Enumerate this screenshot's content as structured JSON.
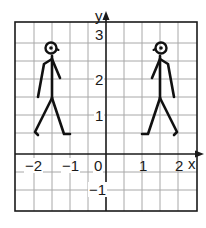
{
  "diagram": {
    "type": "coordinate-grid-reflection",
    "colors": {
      "grid": "#a8a8a8",
      "axes": "#1a1a1a",
      "border": "#1a1a1a",
      "figure": "#111111",
      "background": "#ffffff"
    },
    "axes": {
      "x_label": "x",
      "y_label": "y",
      "x_range": [
        -2.5,
        2.5
      ],
      "y_range": [
        -1.5,
        3.75
      ],
      "grid_step": 0.5,
      "x_ticks": [
        {
          "value": -2,
          "label": "−2"
        },
        {
          "value": -1,
          "label": "−1"
        },
        {
          "value": 0,
          "label": "0"
        },
        {
          "value": 1,
          "label": "1"
        },
        {
          "value": 2,
          "label": "2"
        }
      ],
      "y_ticks": [
        {
          "value": 3,
          "label": "3"
        },
        {
          "value": 2,
          "label": "2"
        },
        {
          "value": 1,
          "label": "1"
        },
        {
          "value": -1,
          "label": "−1"
        }
      ]
    },
    "figures": [
      {
        "name": "left-stick-figure",
        "position": "left of y-axis",
        "x_span": [
          -2,
          -1
        ],
        "y_span": [
          0.5,
          3
        ]
      },
      {
        "name": "right-stick-figure",
        "position": "right of y-axis (mirror image)",
        "x_span": [
          1,
          2
        ],
        "y_span": [
          0.5,
          3
        ]
      }
    ]
  }
}
